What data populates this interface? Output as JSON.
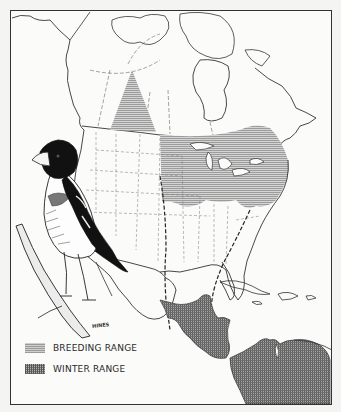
{
  "map": {
    "subject": "Rose-breasted Grosbeak range map",
    "region": "North, Central and northern South America",
    "artist_signature": "HINES"
  },
  "legend": {
    "items": [
      {
        "label": "BREEDING RANGE",
        "pattern": "horizontal-hatch"
      },
      {
        "label": "WINTER RANGE",
        "pattern": "crosshatch"
      }
    ]
  },
  "colors": {
    "outline": "#333333",
    "breeding_fill": "#b3b3b3",
    "winter_fill": "#8a8a8a",
    "paper": "#fbfbfa",
    "bird_dark": "#111111"
  }
}
